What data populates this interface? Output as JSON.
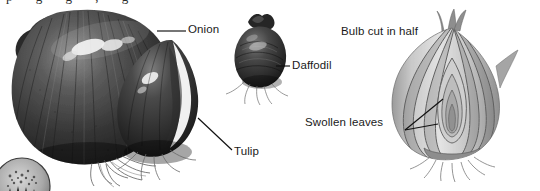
{
  "figure": {
    "type": "botanical-illustration",
    "background_color": "#ffffff",
    "ink_color": "#1a1a1a"
  },
  "labels": {
    "onion": "Onion",
    "daffodil": "Daffodil",
    "tulip": "Tulip",
    "bulb_cut": "Bulb cut in half",
    "swollen_leaves": "Swollen leaves"
  },
  "specimens": [
    {
      "name": "onion-bulb",
      "label": "Onion",
      "description": "Large dark whole onion bulb with radiating ridges, specular highlights and fibrous roots",
      "tone": "dark"
    },
    {
      "name": "tulip-bulb",
      "label": "Tulip",
      "description": "Dark teardrop bulb overlapping the onion, bright crescent highlight on papery tunic",
      "tone": "dark"
    },
    {
      "name": "daffodil-bulb",
      "label": "Daffodil",
      "description": "Small dark rounded bulb with pointed neck and root fringe",
      "tone": "dark"
    },
    {
      "name": "cut-bulb",
      "label": "Bulb cut in half",
      "description": "Longitudinal section showing concentric swollen leaf scales around a nested central shoot, roots at basal plate",
      "tone": "light"
    },
    {
      "name": "circular-inset",
      "label": "",
      "description": "Partially cropped circular micrograph inset at lower-left corner",
      "tone": "mid"
    }
  ],
  "leaders": [
    {
      "name": "leader-onion",
      "style": "straight-horizontal",
      "from": "Onion label",
      "to": "onion bulb shoulder"
    },
    {
      "name": "leader-daffodil",
      "style": "straight-horizontal",
      "from": "Daffodil label",
      "to": "daffodil bulb"
    },
    {
      "name": "leader-tulip",
      "style": "straight-diagonal",
      "from": "Tulip label",
      "to": "tulip bulb body"
    },
    {
      "name": "leader-swollen-upper",
      "style": "straight-diagonal",
      "from": "Swollen leaves label",
      "to": "outer leaf scale"
    },
    {
      "name": "leader-swollen-lower",
      "style": "straight-diagonal",
      "from": "Swollen leaves label",
      "to": "inner leaf scale"
    }
  ],
  "clipped_text": {
    "top_edge": "p g g , g"
  }
}
